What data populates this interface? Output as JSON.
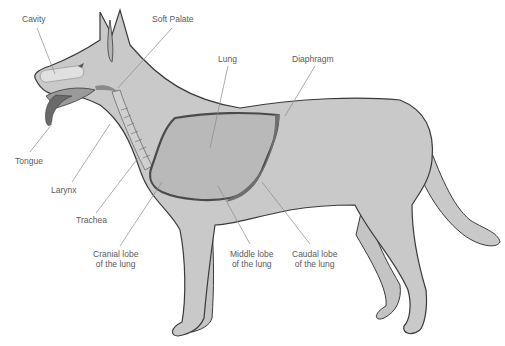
{
  "diagram": {
    "colors": {
      "body": "#c9c9c9",
      "outline": "#3a3a3a",
      "lung": "#b9b9b9",
      "diaphragm": "#6e6e6e",
      "leader": "#8a8a8a",
      "text": "#5a5a5a"
    },
    "labels": {
      "cavity": "Cavity",
      "soft_palate": "Soft Palate",
      "lung": "Lung",
      "diaphragm": "Diaphragm",
      "tongue": "Tongue",
      "larynx": "Larynx",
      "trachea": "Trachea",
      "cranial_lobe_1": "Cranial lobe",
      "cranial_lobe_2": "of the lung",
      "middle_lobe_1": "Middle lobe",
      "middle_lobe_2": "of the lung",
      "caudal_lobe_1": "Caudal lobe",
      "caudal_lobe_2": "of the lung"
    }
  }
}
